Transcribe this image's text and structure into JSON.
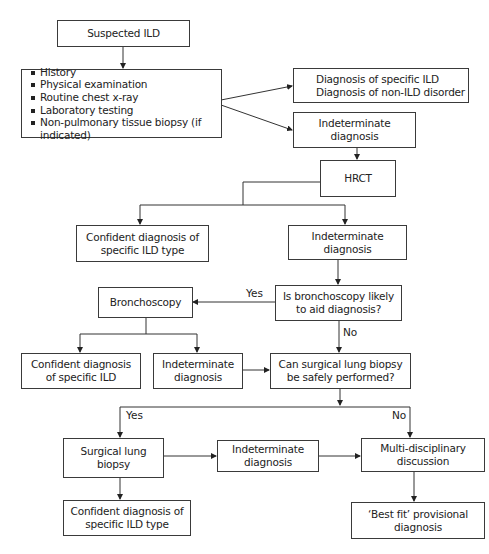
{
  "diagram": {
    "type": "flowchart",
    "nodes": {
      "suspected": "Suspected ILD",
      "workup": [
        "History",
        "Physical examination",
        "Routine chest x-ray",
        "Laboratory testing",
        "Non-pulmonary tissue biopsy (if indicated)"
      ],
      "specific_line1": "Diagnosis of specific ILD",
      "specific_line2": "Diagnosis of non-ILD disorder",
      "indet1_line1": "Indeterminate",
      "indet1_line2": "diagnosis",
      "hrct": "HRCT",
      "confident1_line1": "Confident diagnosis of",
      "confident1_line2": "specific ILD type",
      "indet2_line1": "Indeterminate",
      "indet2_line2": "diagnosis",
      "bronchoscopy": "Bronchoscopy",
      "q_bronch_line1": "Is bronchoscopy likely",
      "q_bronch_line2": "to aid diagnosis?",
      "confident2_line1": "Confident diagnosis",
      "confident2_line2": "of specific ILD",
      "indet3_line1": "Indeterminate",
      "indet3_line2": "diagnosis",
      "q_surgical_line1": "Can surgical lung biopsy",
      "q_surgical_line2": "be safely performed?",
      "surgical_line1": "Surgical lung",
      "surgical_line2": "biopsy",
      "indet4_line1": "Indeterminate",
      "indet4_line2": "diagnosis",
      "mdt_line1": "Multi-disciplinary",
      "mdt_line2": "discussion",
      "confident3_line1": "Confident diagnosis of",
      "confident3_line2": "specific ILD type",
      "bestfit_line1": "‘Best fit’ provisional",
      "bestfit_line2": "diagnosis"
    },
    "edge_labels": {
      "bronch_yes": "Yes",
      "bronch_no": "No",
      "surgical_yes": "Yes",
      "surgical_no": "No"
    }
  }
}
